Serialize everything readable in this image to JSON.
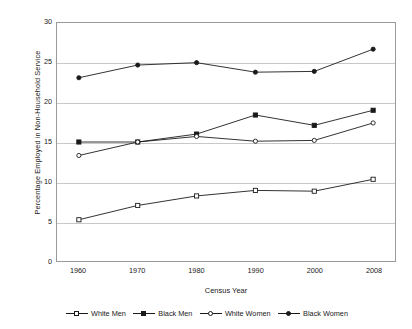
{
  "chart_data": {
    "type": "line",
    "title": "",
    "xlabel": "Census Year",
    "ylabel": "Percentage Employed in Non-Household Service",
    "categories": [
      "1960",
      "1970",
      "1980",
      "1990",
      "2000",
      "2008"
    ],
    "x_tick_labels": [
      "1960",
      "1970",
      "1980",
      "1990",
      "2000",
      "2008"
    ],
    "y_tick_labels": [
      "0",
      "5",
      "10",
      "15",
      "20",
      "25",
      "30"
    ],
    "y_ticks": [
      0,
      5,
      10,
      15,
      20,
      25,
      30
    ],
    "ylim": [
      0,
      30
    ],
    "grid": "horizontal",
    "legend_position": "bottom",
    "series": [
      {
        "name": "White Men",
        "marker": "open-square",
        "color": "#1a1a1a",
        "values": [
          5.2,
          7.0,
          8.2,
          8.9,
          8.8,
          10.3
        ]
      },
      {
        "name": "Black Men",
        "marker": "filled-square",
        "color": "#1a1a1a",
        "values": [
          15.0,
          15.0,
          16.0,
          18.4,
          17.1,
          19.0
        ]
      },
      {
        "name": "White Women",
        "marker": "open-circle",
        "color": "#1a1a1a",
        "values": [
          13.3,
          15.0,
          15.7,
          15.1,
          15.2,
          17.4
        ]
      },
      {
        "name": "Black Women",
        "marker": "filled-circle",
        "color": "#1a1a1a",
        "values": [
          23.1,
          24.7,
          25.0,
          23.8,
          23.9,
          26.7
        ]
      }
    ]
  },
  "legend": {
    "items": [
      {
        "label": "White Men"
      },
      {
        "label": "Black Men"
      },
      {
        "label": "White Women"
      },
      {
        "label": "Black Women"
      }
    ]
  },
  "axes": {
    "x_title": "Census Year",
    "y_title": "Percentage Employed in Non-Household Service"
  }
}
